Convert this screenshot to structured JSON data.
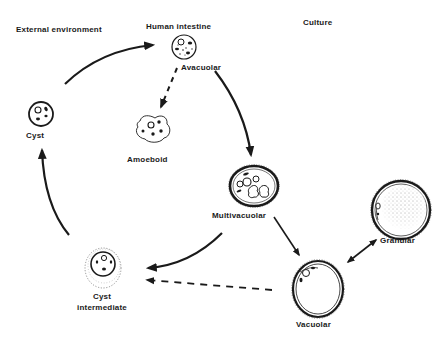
{
  "diagram": {
    "type": "life-cycle",
    "regions": {
      "external": "External environment",
      "intestine": "Human intestine",
      "culture": "Culture"
    },
    "stages": {
      "avacuolar": "Avacuolar",
      "amoeboid": "Amoeboid",
      "cyst": "Cyst",
      "multivacuolar": "Multivacuolar",
      "granular": "Granular",
      "vacuolar": "Vacuolar",
      "cyst_intermediate_line1": "Cyst",
      "cyst_intermediate_line2": "intermediate"
    },
    "edges": [
      {
        "from": "Cyst",
        "to": "Avacuolar",
        "style": "solid"
      },
      {
        "from": "Avacuolar",
        "to": "Amoeboid",
        "style": "dashed"
      },
      {
        "from": "Avacuolar",
        "to": "Multivacuolar",
        "style": "solid"
      },
      {
        "from": "Multivacuolar",
        "to": "Vacuolar",
        "style": "solid"
      },
      {
        "from": "Vacuolar",
        "to": "Granular",
        "style": "solid",
        "bidirectional": true
      },
      {
        "from": "Multivacuolar",
        "to": "Cyst intermediate",
        "style": "solid"
      },
      {
        "from": "Vacuolar",
        "to": "Cyst intermediate",
        "style": "dashed"
      },
      {
        "from": "Cyst intermediate",
        "to": "Cyst",
        "style": "solid"
      }
    ],
    "colors": {
      "ink": "#1a1a1a",
      "background": "#ffffff"
    }
  }
}
